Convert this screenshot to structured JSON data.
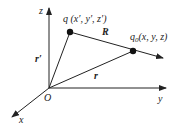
{
  "diagram": {
    "type": "vector-diagram-3d-coordinates",
    "colors": {
      "line": "#222222",
      "background": "#ffffff"
    },
    "axes": {
      "x": {
        "label": "x"
      },
      "y": {
        "label": "y"
      },
      "z": {
        "label": "z"
      }
    },
    "origin": {
      "label": "O"
    },
    "points": {
      "source": {
        "name": "q",
        "coords": "(x′, y′, z′)",
        "label": "q (x′, y′, z′)"
      },
      "field": {
        "name": "q₀",
        "coords": "(x, y, z)",
        "label_main": "q",
        "label_sub": "0",
        "label_coords": "(x, y, z)"
      }
    },
    "vectors": {
      "R": {
        "label": "R",
        "from": "q",
        "to": "q₀"
      },
      "r_prime": {
        "label": "r′",
        "from": "O",
        "to": "q"
      },
      "r": {
        "label": "r",
        "from": "O",
        "to": "q₀"
      }
    }
  }
}
